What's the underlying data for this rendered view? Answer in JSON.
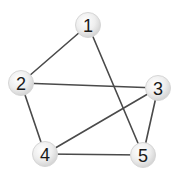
{
  "diagram": {
    "type": "undirected-graph",
    "colors": {
      "edge": "#4a4a4a",
      "node_fill_light": "#ffffff",
      "node_fill_dark": "#d2d2d2",
      "label": "#1a1a1a"
    },
    "nodes": [
      {
        "id": "1",
        "label": "1",
        "x": 88,
        "y": 25,
        "r": 12.5
      },
      {
        "id": "2",
        "label": "2",
        "x": 21,
        "y": 83,
        "r": 12.5
      },
      {
        "id": "3",
        "label": "3",
        "x": 158,
        "y": 88,
        "r": 12.5
      },
      {
        "id": "4",
        "label": "4",
        "x": 45,
        "y": 154,
        "r": 12.5
      },
      {
        "id": "5",
        "label": "5",
        "x": 143,
        "y": 155,
        "r": 12.5
      }
    ],
    "edges": [
      {
        "from": "1",
        "to": "2"
      },
      {
        "from": "1",
        "to": "5"
      },
      {
        "from": "2",
        "to": "3"
      },
      {
        "from": "2",
        "to": "4"
      },
      {
        "from": "3",
        "to": "4"
      },
      {
        "from": "3",
        "to": "5"
      },
      {
        "from": "4",
        "to": "5"
      }
    ]
  }
}
